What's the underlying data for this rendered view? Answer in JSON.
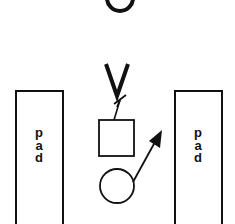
{
  "diagram": {
    "top_symbol": "O",
    "middle_symbol": "V",
    "pads": [
      {
        "id": "left",
        "label_chars": [
          "p",
          "a",
          "d"
        ]
      },
      {
        "id": "right",
        "label_chars": [
          "p",
          "a",
          "d"
        ]
      }
    ],
    "shapes": {
      "square": "square-block",
      "circle": "circle-node",
      "arrow": "diagonal-arrow"
    },
    "colors": {
      "stroke": "#111111",
      "background": "#ffffff"
    }
  }
}
